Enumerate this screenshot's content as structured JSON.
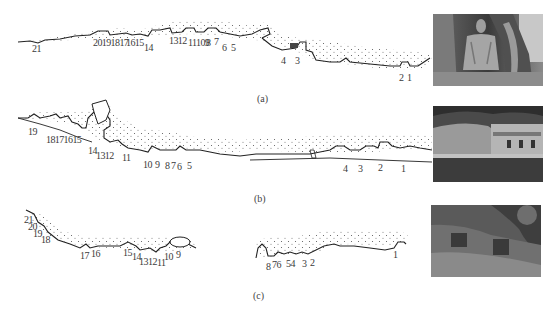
{
  "panels": [
    {
      "id": "a",
      "caption": "(a)",
      "caption_pos": [
        257,
        93
      ],
      "photo": {
        "desc": "seated-buddha-grotto-photo",
        "x": 433,
        "y": 14,
        "w": 110,
        "h": 72
      },
      "labels": [
        {
          "text": "21",
          "x": 32,
          "y": 44
        },
        {
          "text": "20191817",
          "x": 93,
          "y": 38
        },
        {
          "text": "1615",
          "x": 126,
          "y": 38
        },
        {
          "text": "14",
          "x": 144,
          "y": 43
        },
        {
          "text": "1312",
          "x": 169,
          "y": 36
        },
        {
          "text": "11109",
          "x": 188,
          "y": 38
        },
        {
          "text": "8",
          "x": 206,
          "y": 38
        },
        {
          "text": "7",
          "x": 214,
          "y": 37
        },
        {
          "text": "6",
          "x": 222,
          "y": 43
        },
        {
          "text": "5",
          "x": 231,
          "y": 43
        },
        {
          "text": "4",
          "x": 281,
          "y": 56
        },
        {
          "text": "3",
          "x": 295,
          "y": 56
        },
        {
          "text": "2",
          "x": 399,
          "y": 73
        },
        {
          "text": "1",
          "x": 407,
          "y": 73
        }
      ]
    },
    {
      "id": "b",
      "caption": "(b)",
      "caption_pos": [
        254,
        193
      ],
      "photo": {
        "desc": "riverside-cliff-temple-photo",
        "x": 433,
        "y": 106,
        "w": 110,
        "h": 76
      },
      "labels": [
        {
          "text": "19",
          "x": 28,
          "y": 127
        },
        {
          "text": "18171615",
          "x": 46,
          "y": 135
        },
        {
          "text": "14",
          "x": 88,
          "y": 146
        },
        {
          "text": "1312",
          "x": 96,
          "y": 151
        },
        {
          "text": "11",
          "x": 122,
          "y": 153
        },
        {
          "text": "10",
          "x": 143,
          "y": 160
        },
        {
          "text": "9",
          "x": 155,
          "y": 160
        },
        {
          "text": "8",
          "x": 165,
          "y": 161
        },
        {
          "text": "7",
          "x": 171,
          "y": 161
        },
        {
          "text": "6",
          "x": 177,
          "y": 162
        },
        {
          "text": "5",
          "x": 187,
          "y": 161
        },
        {
          "text": "4",
          "x": 343,
          "y": 164
        },
        {
          "text": "3",
          "x": 358,
          "y": 164
        },
        {
          "text": "2",
          "x": 378,
          "y": 163
        },
        {
          "text": "1",
          "x": 401,
          "y": 164
        }
      ]
    },
    {
      "id": "c",
      "caption": "(c)",
      "caption_pos": [
        253,
        290
      ],
      "photo": {
        "desc": "wooded-cliff-grotto-photo",
        "x": 431,
        "y": 205,
        "w": 110,
        "h": 72
      },
      "labels": [
        {
          "text": "21",
          "x": 24,
          "y": 215
        },
        {
          "text": "20",
          "x": 28,
          "y": 222
        },
        {
          "text": "19",
          "x": 33,
          "y": 229
        },
        {
          "text": "18",
          "x": 41,
          "y": 235
        },
        {
          "text": "17",
          "x": 80,
          "y": 251
        },
        {
          "text": "16",
          "x": 91,
          "y": 249
        },
        {
          "text": "15",
          "x": 123,
          "y": 248
        },
        {
          "text": "14",
          "x": 132,
          "y": 252
        },
        {
          "text": "13",
          "x": 139,
          "y": 257
        },
        {
          "text": "12",
          "x": 148,
          "y": 257
        },
        {
          "text": "11",
          "x": 157,
          "y": 258
        },
        {
          "text": "10",
          "x": 164,
          "y": 252
        },
        {
          "text": "9",
          "x": 176,
          "y": 250
        },
        {
          "text": "8",
          "x": 266,
          "y": 262
        },
        {
          "text": "76",
          "x": 272,
          "y": 260
        },
        {
          "text": "54",
          "x": 286,
          "y": 259
        },
        {
          "text": "3",
          "x": 302,
          "y": 259
        },
        {
          "text": "2",
          "x": 310,
          "y": 258
        },
        {
          "text": "1",
          "x": 393,
          "y": 250
        }
      ]
    }
  ]
}
